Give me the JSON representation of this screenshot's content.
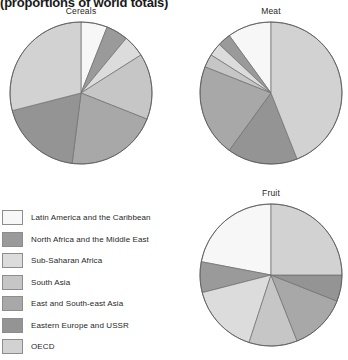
{
  "page": {
    "title": "(proportions of world totals)"
  },
  "legend": {
    "items": [
      {
        "label": "Latin America and the Caribbean",
        "color": "#f7f7f7"
      },
      {
        "label": "North Africa and the Middle East",
        "color": "#9a9a9a"
      },
      {
        "label": "Sub-Saharan Africa",
        "color": "#dcdcdc"
      },
      {
        "label": "South Asia",
        "color": "#c6c6c6"
      },
      {
        "label": "East and South-east Asia",
        "color": "#a8a8a8"
      },
      {
        "label": "Eastern Europe and USSR",
        "color": "#949494"
      },
      {
        "label": "OECD",
        "color": "#d2d2d2"
      }
    ]
  },
  "chart_data": [
    {
      "type": "pie",
      "title": "Cereals",
      "labels": [
        "Latin America and the Caribbean",
        "North Africa and the Middle East",
        "Sub-Saharan Africa",
        "South Asia",
        "East and South-east Asia",
        "Eastern Europe and USSR",
        "OECD"
      ],
      "values": [
        6,
        5,
        5,
        15,
        21,
        19,
        29
      ],
      "colors": [
        "#f7f7f7",
        "#9a9a9a",
        "#dcdcdc",
        "#c6c6c6",
        "#a8a8a8",
        "#949494",
        "#d2d2d2"
      ],
      "start_angle": 0,
      "direction": "clockwise",
      "units": "percent of world total"
    },
    {
      "type": "pie",
      "title": "Meat",
      "labels": [
        "Latin America and the Caribbean",
        "North Africa and the Middle East",
        "Sub-Saharan Africa",
        "South Asia",
        "East and South-east Asia",
        "Eastern Europe and USSR",
        "OECD"
      ],
      "values": [
        10,
        3,
        3,
        3,
        21,
        16,
        44
      ],
      "colors": [
        "#f7f7f7",
        "#9a9a9a",
        "#dcdcdc",
        "#c6c6c6",
        "#a8a8a8",
        "#949494",
        "#d2d2d2"
      ],
      "start_angle": 0,
      "direction": "counterclockwise",
      "units": "percent of world total"
    },
    {
      "type": "pie",
      "title": "Fruit",
      "labels": [
        "Latin America and the Caribbean",
        "North Africa and the Middle East",
        "Sub-Saharan Africa",
        "South Asia",
        "East and South-east Asia",
        "Eastern Europe and USSR",
        "OECD"
      ],
      "values": [
        22,
        7,
        16,
        11,
        13,
        6,
        25
      ],
      "colors": [
        "#f7f7f7",
        "#9a9a9a",
        "#dcdcdc",
        "#c6c6c6",
        "#a8a8a8",
        "#949494",
        "#d2d2d2"
      ],
      "start_angle": 0,
      "direction": "counterclockwise",
      "units": "percent of world total"
    }
  ]
}
